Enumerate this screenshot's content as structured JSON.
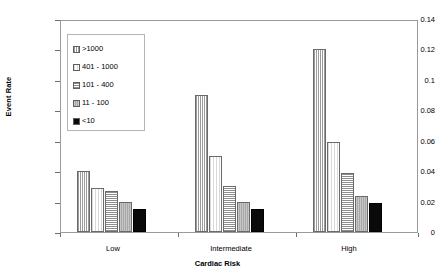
{
  "chart_data": {
    "type": "bar",
    "title": "",
    "xlabel": "Cardiac Risk",
    "ylabel": "Event Rate",
    "categories": [
      "Low",
      "Intermediate",
      "High"
    ],
    "ylim": [
      0,
      0.14
    ],
    "ytick_labels": [
      "0.14",
      "0.12",
      "0.1",
      "0.08",
      "0.06",
      "0.04",
      "0.02",
      "0"
    ],
    "ytick_values": [
      0.14,
      0.12,
      0.1,
      0.08,
      0.06,
      0.04,
      0.02,
      0
    ],
    "grid": false,
    "legend_position": "upper-left-inside",
    "series": [
      {
        "name": ">1000",
        "pattern": "vertical-lines",
        "values": [
          0.04,
          0.09,
          0.12
        ]
      },
      {
        "name": "401 - 1000",
        "pattern": "light-dots",
        "values": [
          0.029,
          0.05,
          0.059
        ]
      },
      {
        "name": "101 - 400",
        "pattern": "horizontal-lines",
        "values": [
          0.027,
          0.03,
          0.039
        ]
      },
      {
        "name": "11 - 100",
        "pattern": "solid-gray",
        "values": [
          0.02,
          0.02,
          0.024
        ]
      },
      {
        "name": "<10",
        "pattern": "solid-black",
        "values": [
          0.015,
          0.015,
          0.019
        ]
      }
    ]
  },
  "legend": {
    "items": [
      {
        "label": ">1000"
      },
      {
        "label": "401 - 1000"
      },
      {
        "label": "101 - 400"
      },
      {
        "label": "11 - 100"
      },
      {
        "label": "<10"
      }
    ]
  },
  "axes": {
    "y_title": "Event Rate",
    "x_title": "Cardiac Risk",
    "y_ticks": [
      "0.14",
      "0.12",
      "0.1",
      "0.08",
      "0.06",
      "0.04",
      "0.02",
      "0"
    ],
    "x_ticks": [
      "Low",
      "Intermediate",
      "High"
    ]
  },
  "colors": {
    "frame": "#9a9a9a",
    "text": "#000000",
    "bar_outline": "#6a6a6a",
    "black_bar": "#0a0a0a",
    "gray_bar": "#a8a8a8"
  }
}
